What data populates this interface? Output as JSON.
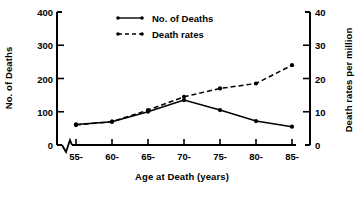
{
  "chart_data": {
    "type": "line",
    "title": "",
    "xlabel": "Age at Death (years)",
    "ylabel": "No. of Deaths",
    "y2label": "Death rates per million",
    "categories": [
      "55-",
      "60-",
      "65-",
      "70-",
      "75-",
      "80-",
      "85-"
    ],
    "ylim": [
      0,
      400
    ],
    "yticks": [
      "0",
      "100",
      "200",
      "300",
      "400"
    ],
    "y2lim": [
      0,
      40
    ],
    "y2ticks": [
      "0",
      "10",
      "20",
      "30",
      "40"
    ],
    "grid": false,
    "legend_position": "top-center",
    "axis_break": true,
    "series": [
      {
        "name": "No. of Deaths",
        "axis": "left",
        "style": "solid",
        "marker": "dot",
        "values": [
          62,
          70,
          100,
          135,
          105,
          72,
          55
        ]
      },
      {
        "name": "Death rates",
        "axis": "right",
        "style": "dashed",
        "marker": "dot",
        "values": [
          6,
          7,
          10.5,
          14.5,
          17,
          18.5,
          24
        ]
      }
    ]
  },
  "legend": {
    "items": [
      {
        "label": "No. of Deaths",
        "style": "solid"
      },
      {
        "label": "Death rates",
        "style": "dashed"
      }
    ]
  },
  "axes": {
    "left": {
      "title": "No. of Deaths",
      "ticks": [
        "400",
        "300",
        "200",
        "100",
        "0"
      ]
    },
    "right": {
      "title": "Death rates per million",
      "ticks": [
        "40",
        "30",
        "20",
        "10",
        "0"
      ]
    },
    "bottom": {
      "title": "Age at Death (years)",
      "ticks": [
        "55-",
        "60-",
        "65-",
        "70-",
        "75-",
        "80-",
        "85-"
      ]
    }
  },
  "colors": {
    "ink": "#000000",
    "background": "#ffffff"
  }
}
